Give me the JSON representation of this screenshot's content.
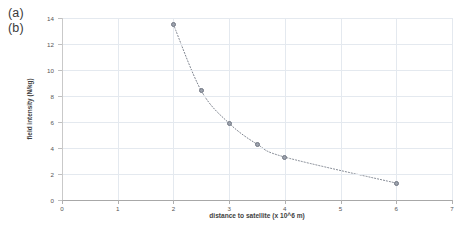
{
  "figure": {
    "labels": [
      "(a)",
      "(b)"
    ]
  },
  "chart_data": {
    "type": "scatter",
    "title": "",
    "xlabel": "distance to satellite (x 10^6 m)",
    "ylabel": "field intensity (N/kg)",
    "xlim": [
      0,
      7
    ],
    "ylim": [
      0,
      14
    ],
    "xticks": [
      "0",
      "1",
      "2",
      "3",
      "4",
      "5",
      "6",
      "7"
    ],
    "xtick_values": [
      0,
      1,
      2,
      3,
      4,
      5,
      6,
      7
    ],
    "yticks": [
      "0",
      "2",
      "4",
      "6",
      "8",
      "10",
      "12",
      "14"
    ],
    "ytick_values": [
      0,
      2,
      4,
      6,
      8,
      10,
      12,
      14
    ],
    "grid": true,
    "legend": "none",
    "series": [
      {
        "name": "field intensity",
        "marker": "circle",
        "marker_color": "#9ca2ad",
        "line_style": "dotted",
        "line_color": "#7d838e",
        "x": [
          2.0,
          2.5,
          3.0,
          3.5,
          4.0,
          6.0
        ],
        "y": [
          13.5,
          8.4,
          5.9,
          4.3,
          3.3,
          1.3
        ]
      }
    ]
  },
  "colors": {
    "grid": "#e4e9ef",
    "axis": "#a8a8a8",
    "text": "#3f3f3f",
    "marker": "#9ca2ad"
  }
}
